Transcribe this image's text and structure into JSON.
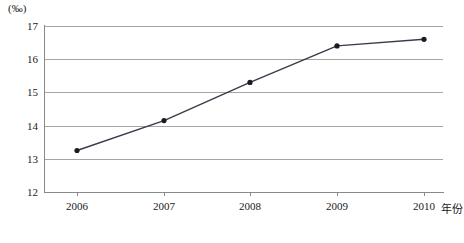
{
  "chart_data": {
    "type": "line",
    "title": "",
    "subtitle": "",
    "xlabel": "年份",
    "ylabel": "",
    "unit_label": "(‰)",
    "categories": [
      "2006",
      "2007",
      "2008",
      "2009",
      "2010"
    ],
    "x": [
      2006,
      2007,
      2008,
      2009,
      2010
    ],
    "values": [
      13.25,
      14.15,
      15.3,
      16.4,
      16.6
    ],
    "series": [
      {
        "name": "",
        "values": [
          13.25,
          14.15,
          15.3,
          16.4,
          16.6
        ]
      }
    ],
    "xlim": [
      2005.6,
      2010.4
    ],
    "ylim": [
      12,
      17
    ],
    "yticks": [
      12,
      13,
      14,
      15,
      16,
      17
    ],
    "ytick_labels": [
      "12",
      "13",
      "14",
      "15",
      "16",
      "17"
    ],
    "xtick_labels": [
      "2006",
      "2007",
      "2008",
      "2009",
      "2010"
    ],
    "grid": "horizontal",
    "legend": "none",
    "marker": "filled-circle",
    "line_color": "#3a3a4a",
    "grid_color": "#a6a6a6",
    "axis_color": "#8a8a8a",
    "marker_color": "#1a1a22",
    "annotations": []
  },
  "axis": {
    "unit_label": "(‰)",
    "x_title": "年份",
    "y_labels": {
      "t17": "17",
      "t16": "16",
      "t15": "15",
      "t14": "14",
      "t13": "13",
      "t12": "12"
    },
    "x_labels": {
      "c0": "2006",
      "c1": "2007",
      "c2": "2008",
      "c3": "2009",
      "c4": "2010"
    }
  }
}
